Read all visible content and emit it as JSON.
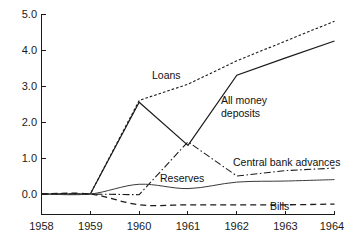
{
  "chart_data": {
    "type": "line",
    "title": "",
    "subtitle": "",
    "xlabel": "",
    "ylabel": "",
    "xlim": [
      1958,
      1964
    ],
    "ylim": [
      -0.55,
      5.0
    ],
    "grid": false,
    "legend_position": "inline-annotations",
    "x_ticks": [
      "1958",
      "1959",
      "1960",
      "1961",
      "1962",
      "1963",
      "1964"
    ],
    "y_ticks": [
      "0.0",
      "1.0",
      "2.0",
      "3.0",
      "4.0",
      "5.0"
    ],
    "x": [
      1958,
      1959,
      1960,
      1961,
      1962,
      1963,
      1964
    ],
    "series": [
      {
        "name": "Loans",
        "style": "dotted",
        "label": "Loans",
        "values": [
          0.0,
          0.0,
          2.6,
          3.05,
          3.7,
          4.25,
          4.8
        ]
      },
      {
        "name": "All money deposits",
        "style": "solid",
        "label": "All money deposits",
        "label_line1": "All money",
        "label_line2": "deposits",
        "values": [
          0.0,
          0.0,
          2.55,
          1.35,
          3.3,
          3.78,
          4.25
        ]
      },
      {
        "name": "Central bank advances",
        "style": "dash-dot",
        "label": "Central bank advances",
        "values": [
          0.0,
          0.0,
          -0.02,
          1.45,
          0.5,
          0.65,
          0.72
        ]
      },
      {
        "name": "Reserves",
        "style": "solid-thin",
        "label": "Reserves",
        "values": [
          0.0,
          0.0,
          0.27,
          0.15,
          0.33,
          0.36,
          0.4
        ]
      },
      {
        "name": "Bills",
        "style": "dashed",
        "label": "Bills",
        "values": [
          0.0,
          0.0,
          -0.3,
          -0.3,
          -0.3,
          -0.3,
          -0.28
        ]
      }
    ]
  },
  "axis": {
    "y_tick_0": "0.0",
    "y_tick_1": "1.0",
    "y_tick_2": "2.0",
    "y_tick_3": "3.0",
    "y_tick_4": "4.0",
    "y_tick_5": "5.0",
    "x_tick_1958": "1958",
    "x_tick_1959": "1959",
    "x_tick_1960": "1960",
    "x_tick_1961": "1961",
    "x_tick_1962": "1962",
    "x_tick_1963": "1963",
    "x_tick_1964": "1964"
  },
  "labels": {
    "loans": "Loans",
    "all_money_line1": "All money",
    "all_money_line2": "deposits",
    "central_bank_advances": "Central bank advances",
    "reserves": "Reserves",
    "bills": "Bills"
  },
  "colors": {
    "ink": "#1a1a1a",
    "background": "#ffffff",
    "thin_line": "#3a3a3a"
  }
}
